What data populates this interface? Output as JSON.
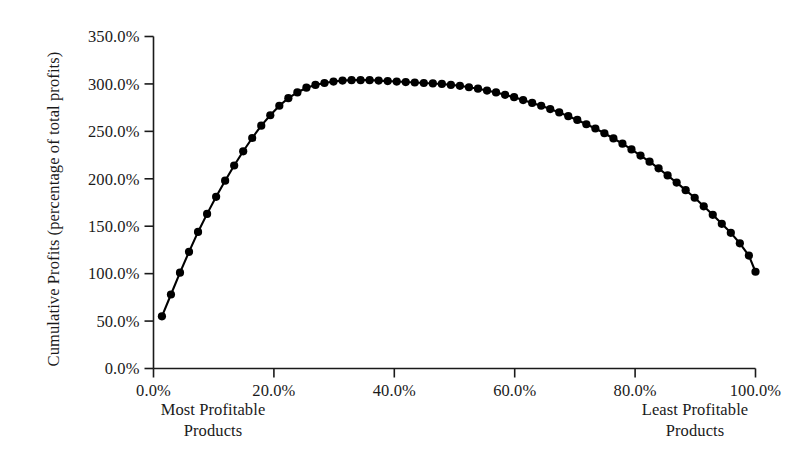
{
  "chart_data": {
    "type": "line",
    "title": "",
    "subtitle": "",
    "xlabel": "",
    "ylabel": "Cumulative Profits (percentage of total profits)",
    "ylabel_line1": "Cumulative Profits",
    "ylabel_line2": "(percentage of total profits)",
    "xlim": [
      0,
      100
    ],
    "ylim": [
      0,
      350
    ],
    "grid": false,
    "legend": null,
    "marker": "filled-circle",
    "marker_color": "#000000",
    "line_color": "#000000",
    "x_tick_labels": [
      "0.0%",
      "20.0%",
      "40.0%",
      "60.0%",
      "80.0%",
      "100.0%"
    ],
    "x_tick_values": [
      0,
      20,
      40,
      60,
      80,
      100
    ],
    "y_tick_labels": [
      "0.0%",
      "50.0%",
      "100.0%",
      "150.0%",
      "200.0%",
      "250.0%",
      "300.0%",
      "350.0%"
    ],
    "y_tick_values": [
      0,
      50,
      100,
      150,
      200,
      250,
      300,
      350
    ],
    "annotations": [
      {
        "name": "most-profitable-note",
        "line1": "Most Profitable",
        "line2": "Products",
        "position": "below-axis-left"
      },
      {
        "name": "least-profitable-note",
        "line1": "Least Profitable",
        "line2": "Products",
        "position": "below-axis-right"
      }
    ],
    "x": [
      1.4,
      2.9,
      4.4,
      5.9,
      7.4,
      8.9,
      10.4,
      11.9,
      13.4,
      14.9,
      16.4,
      17.9,
      19.4,
      20.9,
      22.4,
      23.9,
      25.4,
      26.9,
      28.4,
      29.9,
      31.4,
      32.9,
      34.4,
      35.9,
      37.4,
      38.9,
      40.4,
      41.9,
      43.4,
      44.9,
      46.4,
      47.9,
      49.4,
      50.9,
      52.4,
      53.9,
      55.4,
      56.9,
      58.4,
      59.9,
      61.4,
      62.9,
      64.4,
      65.9,
      67.4,
      68.9,
      70.4,
      71.9,
      73.4,
      74.9,
      76.4,
      77.9,
      79.4,
      80.9,
      82.4,
      83.9,
      85.4,
      86.9,
      88.4,
      89.9,
      91.4,
      92.9,
      94.4,
      95.9,
      97.4,
      98.9,
      100.0
    ],
    "values": [
      55,
      78,
      101,
      123,
      144,
      163,
      181,
      198,
      214,
      229,
      243,
      256,
      267,
      277,
      285,
      291,
      296,
      299,
      301,
      302.5,
      303.5,
      304,
      304,
      304,
      303.5,
      303,
      302.5,
      302,
      301.5,
      301,
      300.5,
      300,
      299,
      298,
      296.5,
      295,
      293,
      291,
      288.5,
      286,
      283,
      280,
      277,
      273.5,
      270,
      266,
      262,
      257.5,
      253,
      248,
      242.5,
      237,
      231,
      224.5,
      218,
      211,
      203.5,
      196,
      188,
      180,
      171,
      162,
      152.5,
      143,
      132,
      119,
      102
    ],
    "series_name": "Cumulative profit curve",
    "peak_value": 304,
    "peak_x": 33,
    "start_value": 55,
    "end_value": 102,
    "n_points": 67
  },
  "meta": {
    "background": "#ffffff",
    "axis_color": "#1a1a1a"
  }
}
